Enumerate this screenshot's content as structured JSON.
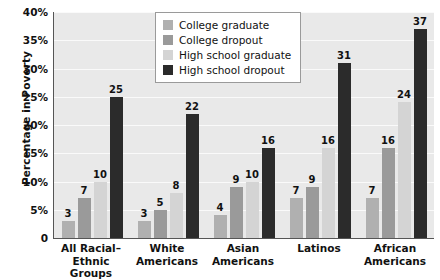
{
  "chart_data": {
    "type": "bar",
    "title": "",
    "xlabel": "",
    "ylabel": "Percentage in Poverty",
    "ylim": [
      0,
      40
    ],
    "grid": true,
    "legend_position": "top-center",
    "y_ticks": [
      "0",
      "5%",
      "10%",
      "15%",
      "20%",
      "25%",
      "30%",
      "35%",
      "40%"
    ],
    "y_tick_values": [
      0,
      5,
      10,
      15,
      20,
      25,
      30,
      35,
      40
    ],
    "categories": [
      "All Racial–Ethnic Groups",
      "White Americans",
      "Asian Americans",
      "Latinos",
      "African Americans"
    ],
    "category_lines": [
      [
        "All Racial–Ethnic",
        "Groups"
      ],
      [
        "White",
        "Americans"
      ],
      [
        "Asian",
        "Americans"
      ],
      [
        "Latinos",
        ""
      ],
      [
        "African",
        "Americans"
      ]
    ],
    "series": [
      {
        "name": "College graduate",
        "color": "#b0b0b0",
        "values": [
          3,
          3,
          4,
          7,
          7
        ]
      },
      {
        "name": "College dropout",
        "color": "#9a9a9a",
        "values": [
          7,
          5,
          9,
          9,
          16
        ]
      },
      {
        "name": "High school graduate",
        "color": "#d4d4d4",
        "values": [
          10,
          8,
          10,
          16,
          24
        ]
      },
      {
        "name": "High school dropout",
        "color": "#2b2b2b",
        "values": [
          25,
          22,
          16,
          31,
          37
        ]
      }
    ]
  }
}
